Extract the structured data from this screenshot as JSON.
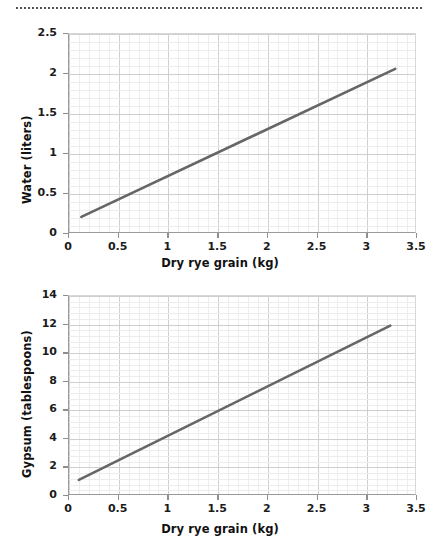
{
  "decoration": {
    "top_rule_style": "dotted"
  },
  "chart_data": [
    {
      "id": "water-vs-grain",
      "type": "line",
      "title": "",
      "xlabel": "Dry rye grain (kg)",
      "ylabel": "Water (liters)",
      "xlim": [
        0,
        3.5
      ],
      "ylim": [
        0,
        2.5
      ],
      "xticks": [
        0,
        0.5,
        1,
        1.5,
        2,
        2.5,
        3,
        3.5
      ],
      "xticklabels": [
        "0",
        "0.5",
        "1",
        "1.5",
        "2",
        "2.5",
        "3",
        "3.5"
      ],
      "yticks": [
        0,
        0.5,
        1,
        1.5,
        2,
        2.5
      ],
      "yticklabels": [
        "0",
        "0.5",
        "1",
        "1.5",
        "2",
        "2.5"
      ],
      "grid": true,
      "minor_grid_divisions": 5,
      "legend": "none",
      "line_color": "#666666",
      "series": [
        {
          "name": "Water needed",
          "x": [
            0.125,
            3.3
          ],
          "values": [
            0.19,
            2.06
          ]
        }
      ],
      "relationship": "linear, approx. Water = 0.59 x Grain + 0.12"
    },
    {
      "id": "gypsum-vs-grain",
      "type": "line",
      "title": "",
      "xlabel": "Dry rye grain (kg)",
      "ylabel": "Gypsum (tablespoons)",
      "xlim": [
        0,
        3.5
      ],
      "ylim": [
        0,
        14
      ],
      "xticks": [
        0,
        0.5,
        1,
        1.5,
        2,
        2.5,
        3,
        3.5
      ],
      "xticklabels": [
        "0",
        "0.5",
        "1",
        "1.5",
        "2",
        "2.5",
        "3",
        "3.5"
      ],
      "yticks": [
        0,
        2,
        4,
        6,
        8,
        10,
        12,
        14
      ],
      "yticklabels": [
        "0",
        "2",
        "4",
        "6",
        "8",
        "10",
        "12",
        "14"
      ],
      "grid": true,
      "minor_grid_divisions": 5,
      "legend": "none",
      "line_color": "#666666",
      "series": [
        {
          "name": "Gypsum needed",
          "x": [
            0.1,
            3.25
          ],
          "values": [
            1.0,
            11.9
          ]
        }
      ],
      "relationship": "linear, approx. Gypsum = 3.46 x Grain + 0.65"
    }
  ]
}
